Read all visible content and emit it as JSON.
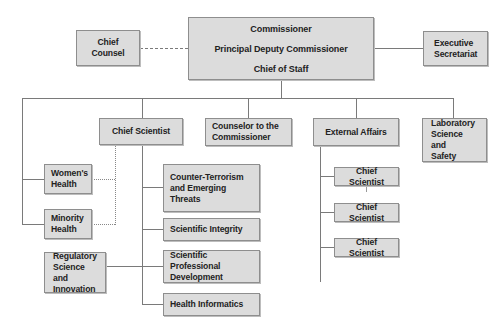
{
  "chart": {
    "top": {
      "lines": [
        "Commissioner",
        "Principal Deputy Commissioner",
        "Chief of Staff"
      ]
    },
    "chief_counsel": "Chief Counsel",
    "executive_secretariat": "Executive\nSecretariat",
    "level2": {
      "chief_scientist": "Chief Scientist",
      "counselor": "Counselor to the\nCommissioner",
      "external_affairs": "External Affairs",
      "laboratory": "Laboratory\nScience and\nSafety"
    },
    "left_offices": {
      "womens_health": "Women's\nHealth",
      "minority_health": "Minority\nHealth",
      "regulatory": "Regulatory\nScience and\nInnovation"
    },
    "chief_scientist_children": [
      "Counter-Terrorism\nand Emerging\nThreats",
      "Scientific Integrity",
      "Scientific Professional\nDevelopment",
      "Health Informatics"
    ],
    "external_affairs_children": [
      "Chief Scientist",
      "Chief Scientist",
      "Chief Scientist"
    ]
  },
  "colors": {
    "box_fill": "#dcdcdc",
    "box_border": "#8e8e8e",
    "line": "#7a7a7a",
    "text": "#222222"
  }
}
